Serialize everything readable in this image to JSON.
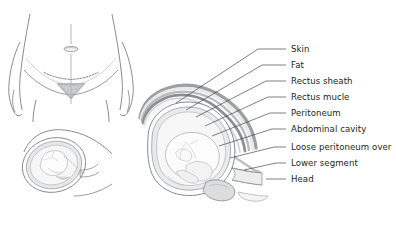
{
  "figure": {
    "background_color": "#ffffff",
    "width": 396,
    "height": 230
  },
  "panels": [
    {
      "name": "abdomen-incision-view",
      "description": "Front view of lower abdomen showing navel, midline and dashed transverse incision line above pubic triangle"
    },
    {
      "name": "uterus-small-side-view",
      "description": "Small oblique view of gravid uterus containing fetus"
    },
    {
      "name": "uterus-sagittal-section",
      "description": "Large sagittal section of gravid uterus with fetus, showing layered abdominal wall"
    }
  ],
  "labels": [
    {
      "id": "skin",
      "text": "Skin",
      "y": 48,
      "leader_x_start": 272,
      "anchor_x": 176,
      "anchor_y": 103
    },
    {
      "id": "fat",
      "text": "Fat",
      "y": 64,
      "leader_x_start": 272,
      "anchor_x": 186,
      "anchor_y": 110
    },
    {
      "id": "rectus-sheath",
      "text": "Rectus sheath",
      "y": 80,
      "leader_x_start": 272,
      "anchor_x": 196,
      "anchor_y": 117
    },
    {
      "id": "rectus-muscle",
      "text": "Rectus mucle",
      "y": 96,
      "leader_x_start": 272,
      "anchor_x": 205,
      "anchor_y": 126
    },
    {
      "id": "peritoneum",
      "text": "Peritoneum",
      "y": 112,
      "leader_x_start": 272,
      "anchor_x": 212,
      "anchor_y": 136
    },
    {
      "id": "abdominal-cavity",
      "text": "Abdominal cavity",
      "y": 128,
      "leader_x_start": 272,
      "anchor_x": 219,
      "anchor_y": 146
    },
    {
      "id": "loose-peritoneum",
      "text": "Loose peritoneum over",
      "y": 146,
      "leader_x_start": 272,
      "anchor_x": 228,
      "anchor_y": 158
    },
    {
      "id": "lower-segment",
      "text": "Lower segment",
      "y": 162,
      "leader_x_start": 272,
      "anchor_x": 238,
      "anchor_y": 168
    },
    {
      "id": "head",
      "text": "Head",
      "y": 178,
      "leader_x_start": 272,
      "anchor_x": 258,
      "anchor_y": 178
    }
  ],
  "colors": {
    "ink": "#231f20",
    "leader_line": "#3a3a3a",
    "outline": "#6d6e71",
    "layer_skin": "#9d9fa2",
    "layer_fat": "#e8e9ea",
    "layer_sheath": "#b9bbbd",
    "layer_muscle": "#8c8e91",
    "layer_peritoneum": "#d4d5d7",
    "uterus_wall": "#a7a9ac",
    "amniotic": "#f2f2f3",
    "fetus": "#fbfbfb"
  }
}
